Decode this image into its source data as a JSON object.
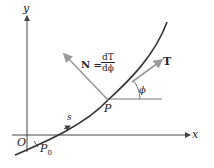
{
  "diagram": {
    "axes": {
      "x_label": "x",
      "y_label": "y",
      "origin_label": "O"
    },
    "points": {
      "p0": "P",
      "p0_sub": "0",
      "p": "P"
    },
    "arc_label": "s",
    "angle_label": "ϕ",
    "tangent_label": "T",
    "normal": {
      "lhs": "N =",
      "num": "dT",
      "den": "dϕ"
    },
    "colors": {
      "curve": "#333333",
      "vector": "#a0a0a0",
      "axis": "#444444"
    }
  }
}
